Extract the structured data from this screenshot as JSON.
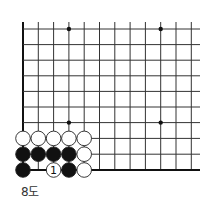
{
  "diagram": {
    "caption": "8도",
    "grid": {
      "x_lines": [
        23,
        38.3,
        53.6,
        68.9,
        84.2,
        99.5,
        114.8,
        130.1,
        145.4,
        160.7,
        176,
        191.3
      ],
      "y_lines": [
        29,
        44.6,
        60.2,
        75.8,
        91.4,
        107,
        122.6,
        138.4,
        154.2,
        170
      ],
      "right_extent": 200,
      "top_extent": 22,
      "left_edge_x": 23,
      "bottom_edge_y": 170,
      "line_color": "#333333",
      "edge_color": "#111111"
    },
    "star_points": [
      {
        "col": 3,
        "row": 0
      },
      {
        "col": 9,
        "row": 0
      },
      {
        "col": 3,
        "row": 6
      },
      {
        "col": 9,
        "row": 6
      }
    ],
    "stones": [
      {
        "col": 0,
        "row": 7,
        "color": "white"
      },
      {
        "col": 1,
        "row": 7,
        "color": "white"
      },
      {
        "col": 2,
        "row": 7,
        "color": "white"
      },
      {
        "col": 3,
        "row": 7,
        "color": "white"
      },
      {
        "col": 4,
        "row": 7,
        "color": "white"
      },
      {
        "col": 0,
        "row": 8,
        "color": "black"
      },
      {
        "col": 1,
        "row": 8,
        "color": "black"
      },
      {
        "col": 2,
        "row": 8,
        "color": "black"
      },
      {
        "col": 3,
        "row": 8,
        "color": "black"
      },
      {
        "col": 4,
        "row": 8,
        "color": "white"
      },
      {
        "col": 0,
        "row": 9,
        "color": "black"
      },
      {
        "col": 2,
        "row": 9,
        "color": "white",
        "label": "1"
      },
      {
        "col": 3,
        "row": 9,
        "color": "black"
      },
      {
        "col": 4,
        "row": 9,
        "color": "white"
      }
    ],
    "stone_radius": 7.3,
    "colors": {
      "black_stone": "#111111",
      "white_stone": "#ffffff",
      "stone_outline": "#222222"
    }
  }
}
